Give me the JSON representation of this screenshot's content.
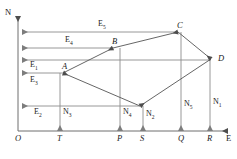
{
  "diagram": {
    "type": "surveying-coordinate-traverse",
    "axes": {
      "vertical_label": "N",
      "horizontal_label": "E",
      "origin_label": "O"
    },
    "points": [
      {
        "id": "A",
        "label": "A",
        "x": 63,
        "y": 73
      },
      {
        "id": "B",
        "label": "B",
        "x": 113,
        "y": 48
      },
      {
        "id": "C",
        "label": "C",
        "x": 178,
        "y": 32
      },
      {
        "id": "D",
        "label": "D",
        "x": 211,
        "y": 59
      },
      {
        "id": "V",
        "label": "",
        "x": 140,
        "y": 106
      }
    ],
    "axis_ticks": [
      {
        "label": "O",
        "x": 18
      },
      {
        "label": "T",
        "x": 60
      },
      {
        "label": "P",
        "x": 120
      },
      {
        "label": "S",
        "x": 143
      },
      {
        "label": "Q",
        "x": 181
      },
      {
        "label": "R",
        "x": 210
      }
    ],
    "easting_arrows": [
      {
        "label": "E",
        "sub": "5",
        "y": 32,
        "from_x": 178,
        "to_x": 22,
        "label_x": 98,
        "label_y": 20
      },
      {
        "label": "E",
        "sub": "4",
        "y": 48,
        "from_x": 113,
        "to_x": 22,
        "label_x": 65,
        "label_y": 36
      },
      {
        "label": "E",
        "sub": "1",
        "y": 60,
        "from_x": 211,
        "to_x": 22,
        "label_x": 30,
        "label_y": 61
      },
      {
        "label": "E",
        "sub": "3",
        "y": 73,
        "from_x": 63,
        "to_x": 22,
        "label_x": 30,
        "label_y": 76
      },
      {
        "label": "E",
        "sub": "2",
        "y": 106,
        "from_x": 140,
        "to_x": 22,
        "label_x": 34,
        "label_y": 108
      }
    ],
    "northing_arrows": [
      {
        "label": "N",
        "sub": "3",
        "x": 60,
        "from_y": 73,
        "to_y": 131,
        "label_x": 63,
        "label_y": 108
      },
      {
        "label": "N",
        "sub": "4",
        "x": 120,
        "from_y": 48,
        "to_y": 131,
        "label_x": 123,
        "label_y": 108
      },
      {
        "label": "N",
        "sub": "2",
        "x": 143,
        "from_y": 106,
        "to_y": 131,
        "label_x": 146,
        "label_y": 110
      },
      {
        "label": "N",
        "sub": "5",
        "x": 181,
        "from_y": 32,
        "to_y": 131,
        "label_x": 184,
        "label_y": 100
      },
      {
        "label": "N",
        "sub": "1",
        "x": 210,
        "from_y": 59,
        "to_y": 131,
        "label_x": 213,
        "label_y": 98
      }
    ],
    "traverse_edges": [
      {
        "from": "A",
        "to": "B"
      },
      {
        "from": "B",
        "to": "C"
      },
      {
        "from": "C",
        "to": "D"
      },
      {
        "from": "D",
        "to": "V"
      },
      {
        "from": "V",
        "to": "A"
      }
    ],
    "colors": {
      "line": "#8c8c8c",
      "traverse": "#555555",
      "axis": "#6e6e6e",
      "text": "#1a1a1a"
    }
  }
}
